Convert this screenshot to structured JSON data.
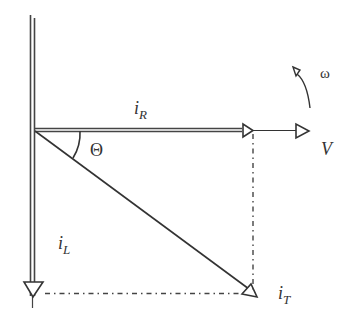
{
  "diagram": {
    "labels": {
      "i_R": {
        "base": "i",
        "sub": "R"
      },
      "i_L": {
        "base": "i",
        "sub": "L"
      },
      "i_T": {
        "base": "i",
        "sub": "T"
      },
      "V": "V",
      "theta": "Θ",
      "omega": "ω"
    },
    "vectors": [
      {
        "name": "i_R",
        "direction": "horizontal right",
        "style": "double line"
      },
      {
        "name": "V",
        "direction": "horizontal right",
        "style": "single line"
      },
      {
        "name": "i_L",
        "direction": "vertical down",
        "style": "double line"
      },
      {
        "name": "i_T",
        "direction": "diagonal down-right",
        "style": "single line"
      }
    ],
    "colors": {
      "stroke": "#333333",
      "background": "#ffffff"
    }
  }
}
